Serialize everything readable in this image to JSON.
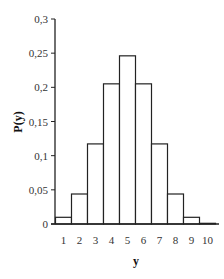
{
  "chart_data": {
    "type": "bar",
    "title": "",
    "xlabel": "y",
    "ylabel": "P(y)",
    "categories": [
      "1",
      "2",
      "3",
      "4",
      "5",
      "6",
      "7",
      "8",
      "9",
      "10"
    ],
    "values": [
      0.0098,
      0.0439,
      0.1172,
      0.2051,
      0.2461,
      0.2051,
      0.1172,
      0.0439,
      0.0098,
      0.001
    ],
    "ylim": [
      0,
      0.3
    ],
    "yticks": [
      "0",
      "0,05",
      "0,1",
      "0,15",
      "0,2",
      "0,25",
      "0,3"
    ],
    "ytick_values": [
      0,
      0.05,
      0.1,
      0.15,
      0.2,
      0.25,
      0.3
    ],
    "grid": false,
    "legend": null,
    "bar_fill": "#ffffff",
    "bar_stroke": "#222222"
  }
}
